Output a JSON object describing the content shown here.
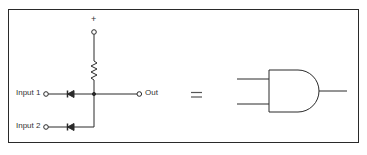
{
  "diagram": {
    "circuit": {
      "supply_label": "+",
      "inputs": [
        {
          "label": "Input 1"
        },
        {
          "label": "Input 2"
        }
      ],
      "output_label": "Out",
      "components": [
        "resistor (pull-up)",
        "diode (input 1)",
        "diode (input 2)"
      ]
    },
    "equals_sign": "=",
    "gate": {
      "type": "AND",
      "inputs": 2,
      "outputs": 1
    },
    "colors": {
      "line": "#2a2a2a",
      "background": "#ffffff"
    }
  }
}
